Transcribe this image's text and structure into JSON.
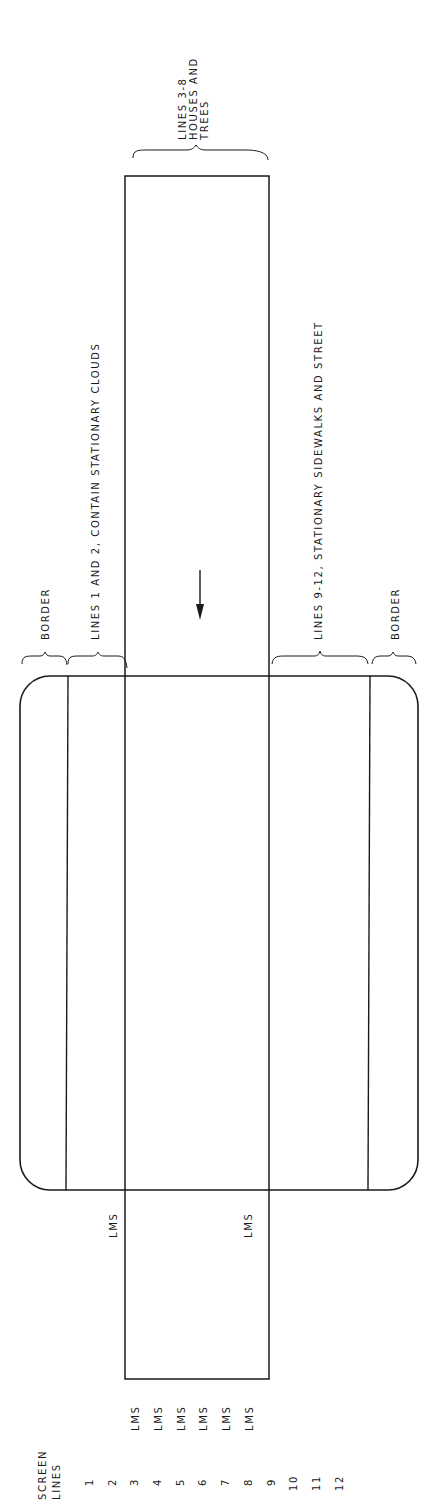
{
  "diagram": {
    "orientation": "rotated 90 degrees counter-clockwise",
    "stroke_color": "#1a1a1a",
    "background": "#ffffff",
    "screen_lines_header": "SCREEN\nLINES",
    "screen_lines": [
      "1",
      "2",
      "3",
      "4",
      "5",
      "6",
      "7",
      "8",
      "9",
      "10",
      "11",
      "12"
    ],
    "lms_column_labels": [
      "LMS",
      "LMS",
      "LMS",
      "LMS",
      "LMS",
      "LMS"
    ],
    "lms_boundary_labels": [
      "LMS",
      "LMS"
    ],
    "regions": [
      {
        "id": "border-left",
        "label": "BORDER"
      },
      {
        "id": "lines-1-2",
        "label": "LINES 1 AND 2, CONTAIN STATIONARY CLOUDS"
      },
      {
        "id": "lines-3-8",
        "label": "LINES 3-8\nHOUSES AND\nTREES"
      },
      {
        "id": "lines-9-12",
        "label": "LINES 9-12, STATIONARY SIDEWALKS AND STREET"
      },
      {
        "id": "border-right",
        "label": "BORDER"
      }
    ],
    "scroll_direction_icon": "arrow-down-icon"
  }
}
